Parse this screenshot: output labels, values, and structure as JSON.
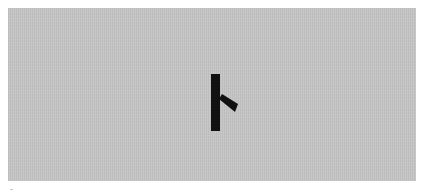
{
  "card": {
    "background_color": "#c6c6c6",
    "glyph": {
      "name": "rune-glyph",
      "description": "Stylized character resembling katakana 'ト' (vertical stroke with right diagonal spur)",
      "color": "#111111"
    }
  },
  "caption": {
    "text": "-"
  }
}
